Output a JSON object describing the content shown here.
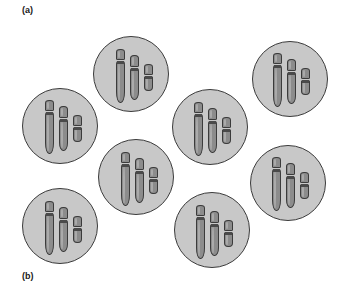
{
  "figure": {
    "width": 339,
    "height": 293,
    "background_color": "#ffffff"
  },
  "labels": {
    "panel_a": "(a)",
    "panel_b": "(b)"
  },
  "style": {
    "cell_fill": "#c8c8c8",
    "cell_border": "#3b3b3b",
    "chromosome_fill": "#8c8c8c",
    "chromosome_highlight": "#ababab",
    "chromosome_border": "#3b3b3b",
    "centromere_color": "#4a4a4a",
    "label_color": "#1a1a1a"
  },
  "diagram": {
    "cell_count": 8,
    "chromosomes_per_cell": 3,
    "cells": [
      {
        "id": "cell-top-middle",
        "name": "cell-1",
        "x": 93,
        "y": 36,
        "size": 76,
        "chromosomes": [
          {
            "name": "chromosome-large",
            "x": 22,
            "y": 12,
            "width": 9,
            "height": 54,
            "short_arm": 11,
            "centromere_y": 12,
            "centromere_h": 3
          },
          {
            "name": "chromosome-medium",
            "x": 36,
            "y": 18,
            "width": 9,
            "height": 45,
            "short_arm": 12,
            "centromere_y": 13,
            "centromere_h": 3
          },
          {
            "name": "chromosome-small",
            "x": 50,
            "y": 27,
            "width": 9,
            "height": 27,
            "short_arm": 11,
            "centromere_y": 12,
            "centromere_h": 3
          }
        ]
      },
      {
        "id": "cell-top-right",
        "name": "cell-2",
        "x": 252,
        "y": 41,
        "size": 76,
        "chromosomes": [
          {
            "name": "chromosome-large",
            "x": 20,
            "y": 11,
            "width": 9,
            "height": 54,
            "short_arm": 11,
            "centromere_y": 12,
            "centromere_h": 3
          },
          {
            "name": "chromosome-medium",
            "x": 34,
            "y": 17,
            "width": 9,
            "height": 45,
            "short_arm": 12,
            "centromere_y": 13,
            "centromere_h": 3
          },
          {
            "name": "chromosome-small",
            "x": 48,
            "y": 26,
            "width": 9,
            "height": 27,
            "short_arm": 11,
            "centromere_y": 12,
            "centromere_h": 3
          }
        ]
      },
      {
        "id": "cell-upper-left",
        "name": "cell-3",
        "x": 22,
        "y": 88,
        "size": 76,
        "chromosomes": [
          {
            "name": "chromosome-large",
            "x": 22,
            "y": 11,
            "width": 9,
            "height": 54,
            "short_arm": 11,
            "centromere_y": 12,
            "centromere_h": 3
          },
          {
            "name": "chromosome-medium",
            "x": 36,
            "y": 17,
            "width": 9,
            "height": 45,
            "short_arm": 12,
            "centromere_y": 13,
            "centromere_h": 3
          },
          {
            "name": "chromosome-small",
            "x": 50,
            "y": 26,
            "width": 9,
            "height": 27,
            "short_arm": 11,
            "centromere_y": 12,
            "centromere_h": 3
          }
        ]
      },
      {
        "id": "cell-center",
        "name": "cell-4",
        "x": 172,
        "y": 89,
        "size": 76,
        "chromosomes": [
          {
            "name": "chromosome-large",
            "x": 21,
            "y": 12,
            "width": 9,
            "height": 54,
            "short_arm": 11,
            "centromere_y": 12,
            "centromere_h": 3
          },
          {
            "name": "chromosome-medium",
            "x": 35,
            "y": 18,
            "width": 9,
            "height": 45,
            "short_arm": 12,
            "centromere_y": 13,
            "centromere_h": 3
          },
          {
            "name": "chromosome-small",
            "x": 49,
            "y": 27,
            "width": 9,
            "height": 27,
            "short_arm": 11,
            "centromere_y": 12,
            "centromere_h": 3
          }
        ]
      },
      {
        "id": "cell-middle-left",
        "name": "cell-5",
        "x": 98,
        "y": 139,
        "size": 76,
        "chromosomes": [
          {
            "name": "chromosome-large",
            "x": 22,
            "y": 12,
            "width": 9,
            "height": 54,
            "short_arm": 11,
            "centromere_y": 12,
            "centromere_h": 3
          },
          {
            "name": "chromosome-medium",
            "x": 36,
            "y": 18,
            "width": 9,
            "height": 45,
            "short_arm": 12,
            "centromere_y": 13,
            "centromere_h": 3
          },
          {
            "name": "chromosome-small",
            "x": 50,
            "y": 27,
            "width": 9,
            "height": 27,
            "short_arm": 11,
            "centromere_y": 12,
            "centromere_h": 3
          }
        ]
      },
      {
        "id": "cell-middle-right",
        "name": "cell-6",
        "x": 250,
        "y": 145,
        "size": 76,
        "chromosomes": [
          {
            "name": "chromosome-large",
            "x": 21,
            "y": 11,
            "width": 9,
            "height": 54,
            "short_arm": 11,
            "centromere_y": 12,
            "centromere_h": 3
          },
          {
            "name": "chromosome-medium",
            "x": 35,
            "y": 17,
            "width": 9,
            "height": 45,
            "short_arm": 12,
            "centromere_y": 13,
            "centromere_h": 3
          },
          {
            "name": "chromosome-small",
            "x": 49,
            "y": 26,
            "width": 9,
            "height": 27,
            "short_arm": 11,
            "centromere_y": 12,
            "centromere_h": 3
          }
        ]
      },
      {
        "id": "cell-bottom-left",
        "name": "cell-7",
        "x": 22,
        "y": 188,
        "size": 76,
        "chromosomes": [
          {
            "name": "chromosome-large",
            "x": 22,
            "y": 12,
            "width": 9,
            "height": 54,
            "short_arm": 11,
            "centromere_y": 12,
            "centromere_h": 3
          },
          {
            "name": "chromosome-medium",
            "x": 36,
            "y": 18,
            "width": 9,
            "height": 45,
            "short_arm": 12,
            "centromere_y": 13,
            "centromere_h": 3
          },
          {
            "name": "chromosome-small",
            "x": 50,
            "y": 27,
            "width": 9,
            "height": 27,
            "short_arm": 11,
            "centromere_y": 12,
            "centromere_h": 3
          }
        ]
      },
      {
        "id": "cell-bottom-middle",
        "name": "cell-8",
        "x": 174,
        "y": 192,
        "size": 76,
        "chromosomes": [
          {
            "name": "chromosome-large",
            "x": 21,
            "y": 12,
            "width": 9,
            "height": 54,
            "short_arm": 11,
            "centromere_y": 12,
            "centromere_h": 3
          },
          {
            "name": "chromosome-medium",
            "x": 35,
            "y": 18,
            "width": 9,
            "height": 45,
            "short_arm": 12,
            "centromere_y": 13,
            "centromere_h": 3
          },
          {
            "name": "chromosome-small",
            "x": 49,
            "y": 27,
            "width": 9,
            "height": 27,
            "short_arm": 11,
            "centromere_y": 12,
            "centromere_h": 3
          }
        ]
      }
    ]
  }
}
